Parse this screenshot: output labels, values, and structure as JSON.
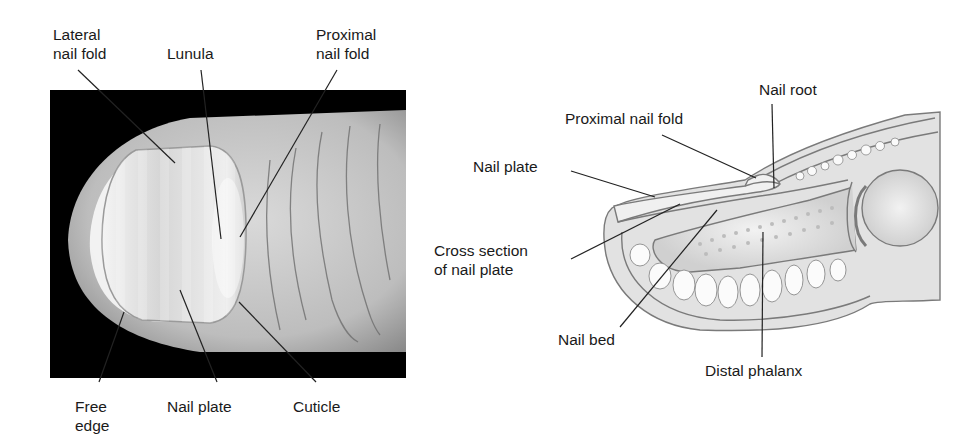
{
  "figure": {
    "left_panel": {
      "kind": "photograph of fingertip, dorsal view",
      "labels": {
        "lateral_nail_fold": [
          "Lateral",
          "nail fold"
        ],
        "lunula": "Lunula",
        "proximal_nail_fold": [
          "Proximal",
          "nail fold"
        ],
        "free_edge": [
          "Free",
          "edge"
        ],
        "nail_plate": "Nail plate",
        "cuticle": "Cuticle"
      }
    },
    "right_panel": {
      "kind": "illustration of fingertip, sagittal cross section",
      "labels": {
        "nail_root": "Nail root",
        "proximal_nail_fold": "Proximal nail fold",
        "nail_plate": "Nail plate",
        "cross_section": [
          "Cross section",
          "of nail plate"
        ],
        "nail_bed": "Nail bed",
        "distal_phalanx": "Distal phalanx"
      }
    },
    "colors": {
      "text": "#1a1a1a",
      "leader_line": "#222222",
      "photo_background": "#000000",
      "skin_light": "#e6e6e6",
      "skin_mid": "#b5b5b5",
      "illustration_fill": "#e4e4e4",
      "illustration_stroke": "#777777"
    }
  }
}
